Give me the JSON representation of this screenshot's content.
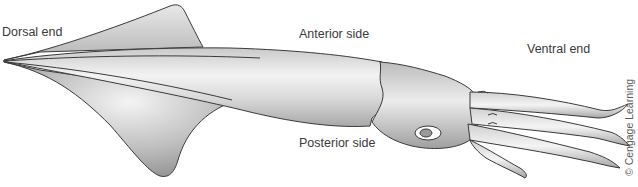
{
  "figure": {
    "labels": {
      "dorsal_end": "Dorsal end",
      "anterior_side": "Anterior side",
      "posterior_side": "Posterior side",
      "ventral_end": "Ventral end"
    },
    "credit": "© Cengage Learning",
    "colors": {
      "outline": "#3a3a3a",
      "body_light": "#f2f2f2",
      "body_mid": "#cfcfcf",
      "body_dark": "#9a9a9a",
      "text": "#3a3a3a"
    }
  }
}
